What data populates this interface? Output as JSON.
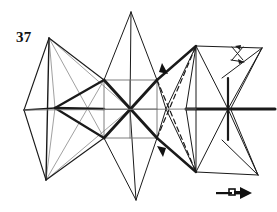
{
  "figure": {
    "number_label": "37",
    "caption": "",
    "background_color": "#ffffff",
    "ink_color": "#1a1a1a",
    "light_ink_color": "#6f6f6f",
    "width": 277,
    "height": 212
  },
  "annotations": {
    "arrowhead_upper": "arrowhead-upper",
    "arrowhead_lower": "arrowhead-lower",
    "axis_marker": "axis-cross-marker",
    "direction_glyph": "direction-arrow-glyph"
  },
  "geometry": {
    "left_bay": {
      "apex_top": [
        49,
        38
      ],
      "apex_bottom": [
        46,
        180
      ],
      "hub_left": [
        24,
        110
      ],
      "hub_center": [
        55,
        108
      ],
      "outer_top": [
        104,
        80
      ],
      "outer_bottom": [
        104,
        138
      ]
    },
    "center_bay": {
      "apex_top": [
        131,
        12
      ],
      "apex_bottom": [
        136,
        200
      ],
      "square_tl": [
        104,
        80
      ],
      "square_tr": [
        157,
        80
      ],
      "square_br": [
        157,
        138
      ],
      "square_bl": [
        104,
        138
      ],
      "hub_center": [
        130,
        109
      ]
    },
    "right_bay": {
      "apex_top": [
        196,
        46
      ],
      "apex_bottom": [
        196,
        172
      ],
      "hub_center": [
        228,
        109
      ],
      "tip_right": [
        275,
        109
      ],
      "arm_upper": [
        262,
        48
      ],
      "arm_lower": [
        258,
        175
      ]
    }
  }
}
